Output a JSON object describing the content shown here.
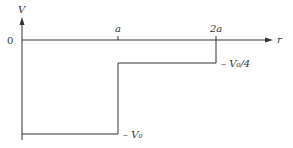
{
  "diagram": {
    "type": "piecewise potential step function",
    "y_axis_label": "V",
    "x_axis_label": "r",
    "origin_label": "0",
    "x_ticks": [
      {
        "label": "a",
        "value": 1
      },
      {
        "label": "2a",
        "value": 2
      }
    ],
    "levels": [
      {
        "label": "– V₀",
        "value": -1,
        "from": 0,
        "to": 1
      },
      {
        "label": "– V₀/4",
        "value": -0.25,
        "from": 1,
        "to": 2
      }
    ],
    "after_2a_value": 0,
    "line_color": "#333333"
  }
}
